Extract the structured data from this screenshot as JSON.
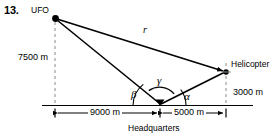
{
  "figure": {
    "problem_number": "13.",
    "points": {
      "ufo": {
        "label": "UFO",
        "x": 55,
        "y": 18
      },
      "helicopter": {
        "label": "Helicopter",
        "x": 226,
        "y": 72
      },
      "headquarters": {
        "label": "Headquarters",
        "x": 160,
        "y": 106
      }
    },
    "dimensions": {
      "ufo_altitude": "7500 m",
      "helicopter_altitude": "3000 m",
      "ufo_ground_distance": "9000 m",
      "helicopter_ground_distance": "5000 m"
    },
    "variables": {
      "range": "r",
      "angle_alpha": "α",
      "angle_beta": "β",
      "angle_gamma": "γ"
    },
    "colors": {
      "stroke": "#000000",
      "dashed": "#8a8a8a",
      "background": "#ffffff"
    }
  }
}
